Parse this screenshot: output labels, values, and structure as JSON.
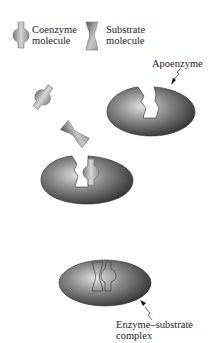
{
  "legend": {
    "coenzyme": {
      "line1": "Coenzyme",
      "line2": "molecule",
      "icon": "coenzyme-icon"
    },
    "substrate": {
      "line1": "Substrate",
      "line2": "molecule",
      "icon": "substrate-icon"
    }
  },
  "labels": {
    "apoenzyme": "Apoenzyme",
    "complex_line1": "Enzyme–substrate",
    "complex_line2": "complex"
  },
  "stages": [
    {
      "name": "apoenzyme",
      "description": "empty enzyme with binding site"
    },
    {
      "name": "free-molecules",
      "description": "coenzyme and substrate unbound"
    },
    {
      "name": "holoenzyme",
      "description": "enzyme with coenzyme bound"
    },
    {
      "name": "enzyme-substrate-complex",
      "description": "enzyme with coenzyme and substrate bound"
    }
  ],
  "colors": {
    "enzyme_dark": "#3a3a3a",
    "enzyme_light": "#d8d8d8",
    "molecule_dark": "#6a6a6a",
    "molecule_light": "#d0d0d0",
    "text": "#222222"
  }
}
